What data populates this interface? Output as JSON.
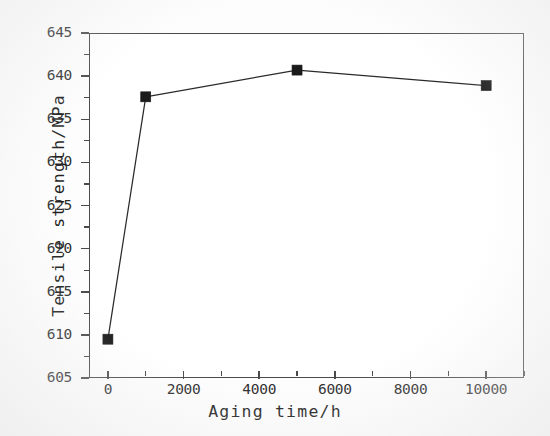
{
  "chart_data": {
    "type": "line",
    "title": "",
    "xlabel": "Aging time/h",
    "ylabel": "Tensile strength/MPa",
    "xlim": [
      -500,
      11000
    ],
    "ylim": [
      605,
      645
    ],
    "grid": false,
    "legend": null,
    "x": [
      0,
      1000,
      5000,
      10000
    ],
    "values": [
      609.5,
      637.6,
      640.7,
      638.9
    ],
    "series": [
      {
        "name": "Tensile strength",
        "x": [
          0,
          1000,
          5000,
          10000
        ],
        "values": [
          609.5,
          637.6,
          640.7,
          638.9
        ],
        "marker": "filled-square",
        "color": "#1a1a1a",
        "line_color": "#2a2a2a"
      }
    ],
    "x_ticks": [
      0,
      2000,
      4000,
      6000,
      8000,
      10000
    ],
    "x_tick_labels": [
      "0",
      "2000",
      "4000",
      "6000",
      "8000",
      "10000"
    ],
    "x_minor_ticks": [
      1000,
      3000,
      5000,
      7000,
      9000,
      11000
    ],
    "y_ticks": [
      605,
      610,
      615,
      620,
      625,
      630,
      635,
      640,
      645
    ],
    "y_tick_labels": [
      "605",
      "610",
      "615",
      "620",
      "625",
      "630",
      "635",
      "640",
      "645"
    ],
    "y_minor_ticks": [
      607.5,
      612.5,
      617.5,
      622.5,
      627.5,
      632.5,
      637.5,
      642.5
    ],
    "axis_color": "#4a4a4a",
    "background": "#ffffff"
  }
}
